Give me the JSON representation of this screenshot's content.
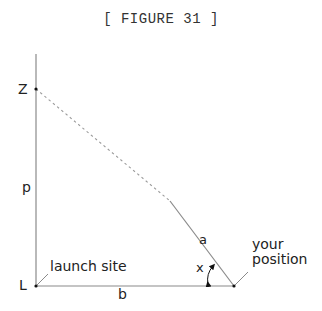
{
  "figure": {
    "caption": "[ FIGURE 31 ]",
    "points": {
      "Z": {
        "label": "Z"
      },
      "L": {
        "label": "L"
      },
      "position": {
        "label_line1": "your",
        "label_line2": "position"
      }
    },
    "segments": {
      "vertical": {
        "label": "p"
      },
      "horizontal": {
        "label": "b"
      },
      "hypotenuse": {
        "label": "a"
      }
    },
    "angle": {
      "label": "x"
    },
    "annotations": {
      "launch_site": "launch site"
    },
    "colors": {
      "line": "#8a8a8a",
      "dashed": "#9a9a9a",
      "point": "#111111",
      "text": "#222222",
      "caption": "#333333"
    }
  }
}
